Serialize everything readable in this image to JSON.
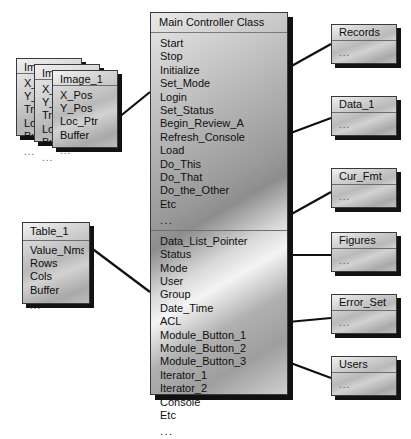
{
  "diagram": {
    "type": "uml-class-diagram",
    "ellipsis": "...",
    "colors": {
      "box_border": "#3a3a3a",
      "shadow": "#121212",
      "line": "#101010",
      "text": "#0d0d0d"
    }
  },
  "main_class": {
    "name": "Main Controller Class",
    "methods": [
      "Start",
      "Stop",
      "Initialize",
      "Set_Mode",
      "Login",
      "Set_Status",
      "Begin_Review_A",
      "Refresh_Console",
      "Load",
      "Do_This",
      "Do_That",
      "Do_the_Other",
      "Etc"
    ],
    "methods_more": "...",
    "attributes": [
      "Data_List_Pointer",
      "Status",
      "Mode",
      "User",
      "Group",
      "Date_Time",
      "ACL",
      "Module_Button_1",
      "Module_Button_2",
      "Module_Button_3",
      "Iterator_1",
      "Iterator_2",
      "Console",
      "Etc"
    ],
    "attributes_more": "..."
  },
  "image_stack": {
    "front": {
      "name": "Image_1",
      "fields": [
        "X_Pos",
        "Y_Pos",
        "Loc_Ptr",
        "Buffer"
      ],
      "more": "..."
    },
    "back_middle": {
      "name": "Im",
      "fields": [
        "X_",
        "Y_",
        "Tra",
        "Loc",
        "Bu"
      ],
      "more": "..."
    },
    "back_rear": {
      "name": "Im",
      "fields": [
        "X_",
        "Y_",
        "Tra",
        "Loc",
        "Bu"
      ],
      "more": "..."
    }
  },
  "table_class": {
    "name": "Table_1",
    "fields": [
      "Value_Nms",
      "Rows",
      "Cols",
      "Buffer"
    ],
    "more": "..."
  },
  "right_boxes": [
    {
      "name": "Records",
      "body": "..."
    },
    {
      "name": "Data_1",
      "body": "..."
    },
    {
      "name": "Cur_Fmt",
      "body": "..."
    },
    {
      "name": "Figures",
      "body": "..."
    },
    {
      "name": "Error_Set",
      "body": "..."
    },
    {
      "name": "Users",
      "body": "..."
    }
  ]
}
